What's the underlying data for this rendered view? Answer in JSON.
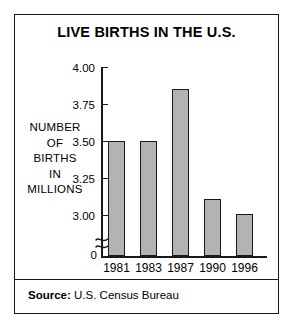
{
  "chart_data": {
    "type": "bar",
    "title": "LIVE BIRTHS IN THE U.S.",
    "categories": [
      "1981",
      "1983",
      "1987",
      "1990",
      "1996"
    ],
    "values": [
      3.5,
      3.5,
      3.85,
      3.11,
      3.01
    ],
    "xlabel": "",
    "ylabel": "NUMBER OF BIRTHS IN MILLIONS",
    "ylabel_lines": [
      "NUMBER",
      "OF",
      "BIRTHS",
      "IN",
      "MILLIONS"
    ],
    "ylim": [
      2.9375,
      4.0
    ],
    "yticks": [
      "3.00",
      "3.25",
      "3.50",
      "3.75",
      "4.00"
    ],
    "ytick_values": [
      3.0,
      3.25,
      3.5,
      3.75,
      4.0
    ],
    "zero_tick": "0",
    "axis_break": true,
    "grid": false,
    "legend": null,
    "bar_color": "#b3b3b3",
    "bar_edge_color": "#1a1a1a"
  },
  "source": {
    "label": "Source:",
    "text": "U.S. Census Bureau"
  }
}
